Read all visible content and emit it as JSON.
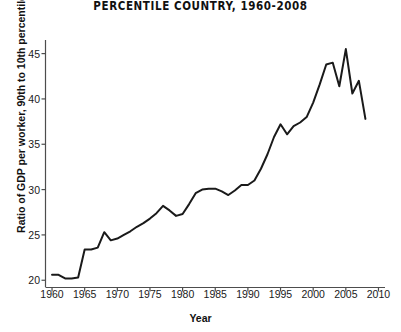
{
  "chart_data": {
    "type": "line",
    "title": "PERCENTILE COUNTRY, 1960-2008",
    "xlabel": "Year",
    "ylabel": "Ratio of GDP per worker, 90th to 10th percentile",
    "xlim": [
      1959,
      2011
    ],
    "ylim": [
      19.2,
      46.5
    ],
    "xticks": [
      1960,
      1965,
      1970,
      1975,
      1980,
      1985,
      1990,
      1995,
      2000,
      2005,
      2010
    ],
    "yticks": [
      20,
      25,
      30,
      35,
      40,
      45
    ],
    "grid": false,
    "legend": null,
    "line_color": "#1a1a1a",
    "line_width": 2.0,
    "x": [
      1960,
      1961,
      1962,
      1963,
      1964,
      1965,
      1966,
      1967,
      1968,
      1969,
      1970,
      1971,
      1972,
      1973,
      1974,
      1975,
      1976,
      1977,
      1978,
      1979,
      1980,
      1981,
      1982,
      1983,
      1984,
      1985,
      1986,
      1987,
      1988,
      1989,
      1990,
      1991,
      1992,
      1993,
      1994,
      1995,
      1996,
      1997,
      1998,
      1999,
      2000,
      2001,
      2002,
      2003,
      2004,
      2005,
      2006,
      2007,
      2008
    ],
    "values": [
      20.6,
      20.6,
      20.2,
      20.2,
      20.3,
      23.4,
      23.4,
      23.6,
      25.3,
      24.4,
      24.6,
      25.0,
      25.4,
      25.9,
      26.3,
      26.8,
      27.4,
      28.2,
      27.7,
      27.1,
      27.3,
      28.4,
      29.6,
      30.0,
      30.1,
      30.1,
      29.8,
      29.4,
      29.9,
      30.5,
      30.5,
      31.0,
      32.3,
      33.9,
      35.8,
      37.2,
      36.1,
      37.0,
      37.4,
      38.0,
      39.6,
      41.6,
      43.8,
      44.0,
      41.4,
      45.5,
      40.6,
      42.0,
      37.8
    ]
  },
  "axes": {
    "ytick_labels": [
      "45",
      "40",
      "35",
      "30",
      "25",
      "20"
    ],
    "xtick_labels": [
      "1960",
      "1965",
      "1970",
      "1975",
      "1980",
      "1985",
      "1990",
      "1995",
      "2000",
      "2005",
      "2010"
    ]
  }
}
